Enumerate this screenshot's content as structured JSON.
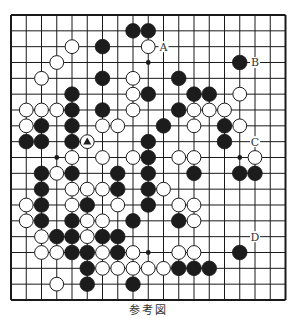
{
  "diagram": {
    "type": "go-board",
    "size": 19,
    "caption": "参考図",
    "grid": {
      "x0": 11,
      "y0": 15,
      "dx": 15.25,
      "dy": 15.833
    },
    "colors": {
      "line": "#1a1a1a",
      "black_stone": "#1c1c1c",
      "white_stone": "#ffffff",
      "stone_edge": "#1a1a1a",
      "label": "#333333"
    },
    "hoshi": [
      [
        3,
        3
      ],
      [
        9,
        3
      ],
      [
        15,
        3
      ],
      [
        3,
        9
      ],
      [
        9,
        9
      ],
      [
        15,
        9
      ],
      [
        3,
        15
      ],
      [
        9,
        15
      ],
      [
        15,
        15
      ]
    ],
    "black_stones": [
      [
        8,
        1
      ],
      [
        9,
        1
      ],
      [
        6,
        2
      ],
      [
        15,
        3
      ],
      [
        6,
        4
      ],
      [
        11,
        4
      ],
      [
        4,
        5
      ],
      [
        9,
        5
      ],
      [
        12,
        5
      ],
      [
        13,
        5
      ],
      [
        4,
        6
      ],
      [
        6,
        6
      ],
      [
        11,
        6
      ],
      [
        2,
        7
      ],
      [
        4,
        7
      ],
      [
        10,
        7
      ],
      [
        14,
        7
      ],
      [
        1,
        8
      ],
      [
        2,
        8
      ],
      [
        4,
        8
      ],
      [
        9,
        8
      ],
      [
        14,
        8
      ],
      [
        9,
        9
      ],
      [
        2,
        10
      ],
      [
        4,
        10
      ],
      [
        7,
        10
      ],
      [
        9,
        10
      ],
      [
        12,
        10
      ],
      [
        15,
        10
      ],
      [
        16,
        10
      ],
      [
        2,
        11
      ],
      [
        7,
        11
      ],
      [
        9,
        11
      ],
      [
        2,
        12
      ],
      [
        5,
        12
      ],
      [
        9,
        12
      ],
      [
        2,
        13
      ],
      [
        4,
        13
      ],
      [
        8,
        13
      ],
      [
        11,
        13
      ],
      [
        3,
        14
      ],
      [
        4,
        14
      ],
      [
        6,
        14
      ],
      [
        7,
        14
      ],
      [
        4,
        15
      ],
      [
        5,
        15
      ],
      [
        7,
        15
      ],
      [
        15,
        15
      ],
      [
        5,
        16
      ],
      [
        11,
        16
      ],
      [
        12,
        16
      ],
      [
        13,
        16
      ],
      [
        5,
        17
      ],
      [
        8,
        17
      ]
    ],
    "white_stones": [
      [
        4,
        2
      ],
      [
        9,
        2
      ],
      [
        3,
        3
      ],
      [
        2,
        4
      ],
      [
        8,
        4
      ],
      [
        8,
        5
      ],
      [
        15,
        5
      ],
      [
        1,
        6
      ],
      [
        2,
        6
      ],
      [
        3,
        6
      ],
      [
        8,
        6
      ],
      [
        12,
        6
      ],
      [
        13,
        6
      ],
      [
        14,
        6
      ],
      [
        1,
        7
      ],
      [
        6,
        7
      ],
      [
        7,
        7
      ],
      [
        12,
        7
      ],
      [
        15,
        7
      ],
      [
        5,
        8
      ],
      [
        4,
        9
      ],
      [
        6,
        9
      ],
      [
        8,
        9
      ],
      [
        11,
        9
      ],
      [
        12,
        9
      ],
      [
        16,
        9
      ],
      [
        3,
        10
      ],
      [
        4,
        11
      ],
      [
        5,
        11
      ],
      [
        6,
        11
      ],
      [
        10,
        11
      ],
      [
        1,
        12
      ],
      [
        4,
        12
      ],
      [
        7,
        12
      ],
      [
        11,
        12
      ],
      [
        12,
        12
      ],
      [
        1,
        13
      ],
      [
        5,
        13
      ],
      [
        6,
        13
      ],
      [
        12,
        13
      ],
      [
        2,
        14
      ],
      [
        5,
        14
      ],
      [
        2,
        15
      ],
      [
        3,
        15
      ],
      [
        6,
        15
      ],
      [
        8,
        15
      ],
      [
        11,
        15
      ],
      [
        12,
        15
      ],
      [
        6,
        16
      ],
      [
        7,
        16
      ],
      [
        8,
        16
      ],
      [
        9,
        16
      ],
      [
        10,
        16
      ],
      [
        3,
        17
      ]
    ],
    "markers": [
      {
        "col": 5,
        "row": 8,
        "shape": "triangle",
        "on": "white"
      }
    ],
    "labels": [
      {
        "text": "A",
        "col": 10,
        "row": 2
      },
      {
        "text": "B",
        "col": 16,
        "row": 3
      },
      {
        "text": "C",
        "col": 16,
        "row": 8
      },
      {
        "text": "D",
        "col": 16,
        "row": 14
      }
    ]
  }
}
